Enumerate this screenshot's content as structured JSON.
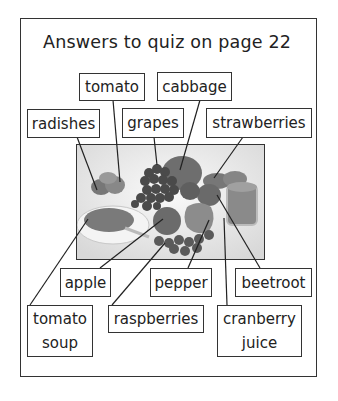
{
  "title": "Answers to quiz on page 22",
  "labels": {
    "tomato": "tomato",
    "cabbage": "cabbage",
    "radishes": "radishes",
    "grapes": "grapes",
    "strawberries": "strawberries",
    "apple": "apple",
    "pepper": "pepper",
    "beetroot": "beetroot",
    "tomato_soup": [
      "tomato",
      "soup"
    ],
    "raspberries": "raspberries",
    "cranberry_juice": [
      "cranberry",
      "juice"
    ]
  },
  "photo": {
    "description": "black-and-white photo of fruits and vegetables: radishes, tomato, grapes, cabbage, strawberries, bowl of tomato soup, apple, raspberries, pepper, beetroot, glass of cranberry juice"
  }
}
